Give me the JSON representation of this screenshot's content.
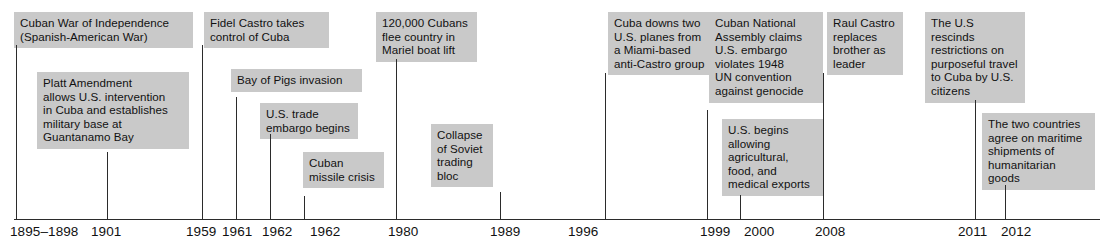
{
  "figure": {
    "kind": "historical-timeline",
    "box_fill": "#c9c9c9",
    "line_color": "#2b2b2b",
    "background": "#ffffff"
  },
  "axis": {
    "orientation": "horizontal",
    "tick_labels": [
      "1895–1898",
      "1901",
      "1959",
      "1961",
      "1962",
      "1962",
      "1980",
      "1989",
      "1996",
      "1999",
      "2000",
      "2008",
      "2011",
      "2012"
    ]
  },
  "events": [
    {
      "id": "cuban-war-independence",
      "year": "1895–1898",
      "text": "Cuban War of Independence\n(Spanish-American War)"
    },
    {
      "id": "platt-amendment",
      "year": "1901",
      "text": "Platt Amendment\nallows U.S. intervention\nin Cuba and establishes\nmilitary base at\nGuantanamo Bay"
    },
    {
      "id": "castro-takes-control",
      "year": "1959",
      "text": "Fidel Castro takes\ncontrol of Cuba"
    },
    {
      "id": "bay-of-pigs",
      "year": "1961",
      "text": "Bay of Pigs invasion"
    },
    {
      "id": "trade-embargo",
      "year": "1962",
      "text": "U.S. trade\nembargo begins"
    },
    {
      "id": "missile-crisis",
      "year": "1962",
      "text": "Cuban\nmissile crisis"
    },
    {
      "id": "mariel-boat-lift",
      "year": "1980",
      "text": "120,000 Cubans\nflee country in\nMariel boat lift"
    },
    {
      "id": "soviet-bloc-collapse",
      "year": "1989",
      "text": "Collapse\nof Soviet\ntrading\nbloc"
    },
    {
      "id": "planes-downed",
      "year": "1996",
      "text": "Cuba downs two\nU.S. planes from\na Miami-based\nanti-Castro group"
    },
    {
      "id": "genocide-claim",
      "year": "1999",
      "text": "Cuban National\nAssembly claims\nU.S. embargo\nviolates 1948\nUN convention\nagainst genocide"
    },
    {
      "id": "agricultural-exports",
      "year": "2000",
      "text": "U.S. begins\nallowing\nagricultural,\nfood, and\nmedical exports"
    },
    {
      "id": "raul-castro-leader",
      "year": "2008",
      "text": "Raul Castro\nreplaces\nbrother as\nleader"
    },
    {
      "id": "travel-restrictions",
      "year": "2011",
      "text": "The U.S rescinds\nrestrictions on\npurposeful travel\nto Cuba by U.S.\ncitizens"
    },
    {
      "id": "maritime-shipments",
      "year": "2012",
      "text": "The two countries\nagree on maritime\nshipments of\nhumanitarian goods"
    }
  ]
}
